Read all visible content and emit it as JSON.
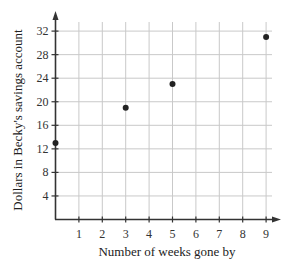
{
  "chart_data": {
    "type": "scatter",
    "title": "",
    "xlabel": "Number of weeks gone by",
    "ylabel": "Dollars in Becky's savings account",
    "xlim": [
      0,
      9
    ],
    "ylim": [
      0,
      32
    ],
    "x_ticks": [
      1,
      2,
      3,
      4,
      5,
      6,
      7,
      8,
      9
    ],
    "y_ticks": [
      4,
      8,
      12,
      16,
      20,
      24,
      28,
      32
    ],
    "grid": true,
    "legend": null,
    "series": [
      {
        "name": "Savings",
        "points": [
          {
            "x": 0,
            "y": 13
          },
          {
            "x": 3,
            "y": 19
          },
          {
            "x": 5,
            "y": 23
          },
          {
            "x": 9,
            "y": 31
          }
        ]
      }
    ]
  },
  "colors": {
    "axis": "#333333",
    "grid": "#c9c9c9",
    "point": "#222222"
  }
}
